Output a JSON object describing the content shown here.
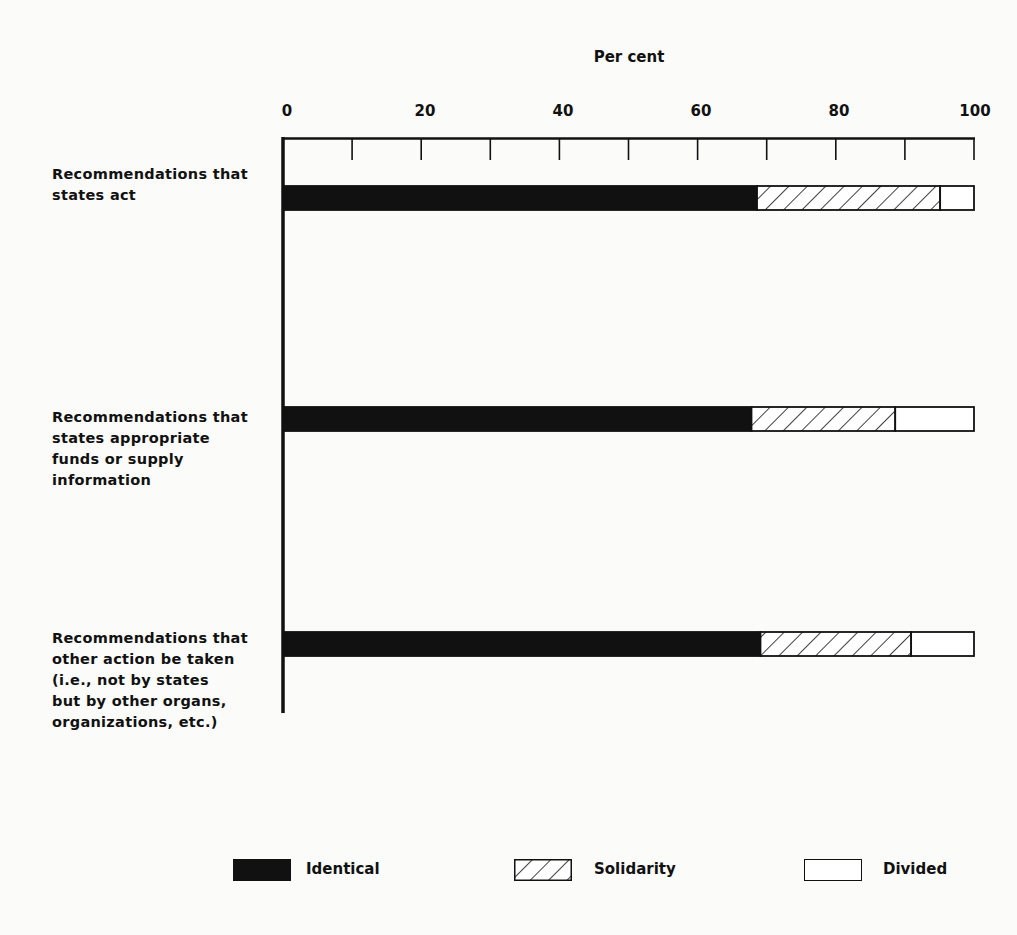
{
  "chart_data": {
    "type": "bar",
    "orientation": "horizontal",
    "stacked": true,
    "title": "",
    "xlabel": "Per cent",
    "ylabel": "",
    "xlim": [
      0,
      100
    ],
    "x_ticks": [
      0,
      20,
      40,
      60,
      80,
      100
    ],
    "minor_tick_step": 10,
    "grid": false,
    "legend_position": "bottom",
    "categories": [
      "Recommendations that states act",
      "Recommendations that states appropriate funds or supply information",
      "Recommendations that other action be taken (i.e., not by states but by other organs, organizations, etc.)"
    ],
    "series": [
      {
        "name": "Identical",
        "values": [
          68.6,
          67.8,
          69.1
        ],
        "pattern": "solid-black"
      },
      {
        "name": "Solidarity",
        "values": [
          26.5,
          20.8,
          21.8
        ],
        "pattern": "diagonal-hatch"
      },
      {
        "name": "Divided",
        "values": [
          4.9,
          11.4,
          9.1
        ],
        "pattern": "white"
      }
    ]
  },
  "axis": {
    "title": "Per cent",
    "ticks": [
      "0",
      "20",
      "40",
      "60",
      "80",
      "100"
    ]
  },
  "categories": [
    {
      "lines": [
        "Recommendations that",
        "states act"
      ]
    },
    {
      "lines": [
        "Recommendations that",
        "states appropriate",
        "funds or supply",
        "information"
      ]
    },
    {
      "lines": [
        "Recommendations that",
        "other action be taken",
        "(i.e., not by states",
        "but by other organs,",
        "organizations, etc.)"
      ]
    }
  ],
  "legend": [
    {
      "label": "Identical",
      "swatch": "solid-black"
    },
    {
      "label": "Solidarity",
      "swatch": "diagonal-hatch"
    },
    {
      "label": "Divided",
      "swatch": "white"
    }
  ],
  "colors": {
    "ink": "#111111",
    "paper": "#fbfbfa"
  }
}
